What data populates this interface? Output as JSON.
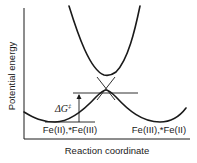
{
  "diagram": {
    "type": "potential-energy-diagram",
    "axes": {
      "y_label": "Potential energy",
      "x_label": "Reaction coordinate"
    },
    "wells": [
      {
        "label": "Fe(II),*Fe(III)"
      },
      {
        "label": "Fe(III),*Fe(II)"
      }
    ],
    "activation": {
      "symbol": "ΔG",
      "superscript": "‡"
    },
    "colors": {
      "line": "#1a1a1a",
      "background": "#ffffff"
    }
  }
}
